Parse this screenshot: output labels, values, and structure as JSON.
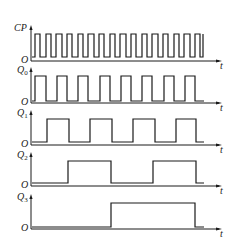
{
  "diagram": {
    "time_label": "t",
    "origin_label": "O",
    "signals": [
      {
        "name": "CP",
        "label_main": "CP",
        "label_sub": "",
        "axis_y": 61,
        "high_y": 34,
        "low_y": 57,
        "edges": [
          35,
          40,
          46,
          51,
          56,
          62,
          67,
          72,
          78,
          83,
          88,
          94,
          99,
          104,
          110,
          115,
          120,
          126,
          131,
          136,
          142,
          147,
          152,
          158,
          163,
          168,
          174,
          179,
          184,
          190,
          195,
          200,
          203
        ],
        "start_level": "low",
        "end_x": 203
      },
      {
        "name": "Q0",
        "label_main": "Q",
        "label_sub": "0",
        "axis_y": 103,
        "high_y": 76,
        "low_y": 101,
        "edges": [
          35,
          46,
          57,
          67,
          78,
          88,
          100,
          110,
          121,
          131,
          142,
          152,
          164,
          174,
          185,
          195
        ],
        "start_level": "low",
        "end_x": 204
      },
      {
        "name": "Q1",
        "label_main": "Q",
        "label_sub": "1",
        "axis_y": 145,
        "high_y": 119,
        "low_y": 142,
        "edges": [
          47,
          69,
          90,
          112,
          133,
          155,
          176,
          196
        ],
        "start_level": "low",
        "end_x": 204
      },
      {
        "name": "Q2",
        "label_main": "Q",
        "label_sub": "2",
        "axis_y": 186,
        "high_y": 161,
        "low_y": 183,
        "edges": [
          68,
          111,
          153,
          196
        ],
        "start_level": "low",
        "end_x": 204
      },
      {
        "name": "Q3",
        "label_main": "Q",
        "label_sub": "3",
        "axis_y": 229,
        "high_y": 203,
        "low_y": 227,
        "edges": [
          111,
          195
        ],
        "start_level": "low",
        "end_x": 204
      }
    ],
    "axis_x": 31,
    "axis_end_x": 222,
    "colors": {
      "line": "#1a1a1a",
      "background": "#ffffff"
    }
  }
}
